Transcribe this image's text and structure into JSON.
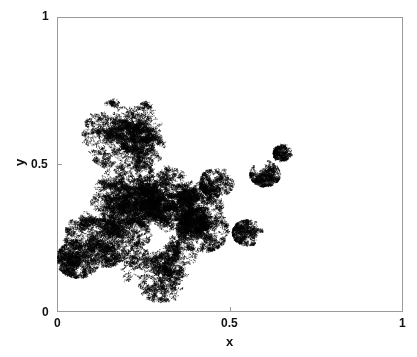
{
  "chart_data": {
    "type": "scatter",
    "title": "",
    "xlabel": "x",
    "ylabel": "y",
    "xlim": [
      0,
      1
    ],
    "ylim": [
      0,
      1
    ],
    "xticks": [
      "0",
      "0.5",
      "1"
    ],
    "yticks": [
      "0",
      "0.5",
      "1"
    ],
    "grid": false,
    "legend": null,
    "series": [
      {
        "name": "random walk trajectory",
        "color": "#000000",
        "description": "Dense 2D random walk cloud confined roughly to x 0-0.5, y 0-0.72, with an arm extending to about (0.65, 0.55) and a small cluster near (0.5-0.6, 0.25-0.3)",
        "extent": {
          "x": [
            0.0,
            0.67
          ],
          "y": [
            0.0,
            0.72
          ]
        },
        "clusters": [
          {
            "x": 0.2,
            "y": 0.6,
            "r": 0.1,
            "weight": 1.0
          },
          {
            "x": 0.25,
            "y": 0.37,
            "r": 0.12,
            "weight": 1.6
          },
          {
            "x": 0.38,
            "y": 0.37,
            "r": 0.08,
            "weight": 0.9
          },
          {
            "x": 0.12,
            "y": 0.25,
            "r": 0.08,
            "weight": 0.7
          },
          {
            "x": 0.3,
            "y": 0.15,
            "r": 0.09,
            "weight": 0.6
          },
          {
            "x": 0.06,
            "y": 0.18,
            "r": 0.05,
            "weight": 0.4
          },
          {
            "x": 0.42,
            "y": 0.28,
            "r": 0.06,
            "weight": 0.5
          },
          {
            "x": 0.55,
            "y": 0.27,
            "r": 0.035,
            "weight": 0.2
          },
          {
            "x": 0.6,
            "y": 0.47,
            "r": 0.035,
            "weight": 0.2
          },
          {
            "x": 0.65,
            "y": 0.54,
            "r": 0.02,
            "weight": 0.12
          },
          {
            "x": 0.46,
            "y": 0.44,
            "r": 0.04,
            "weight": 0.2
          }
        ]
      }
    ]
  },
  "axes": {
    "x_tick_0": "0",
    "x_tick_half": "0.5",
    "x_tick_1": "1",
    "y_tick_0": "0",
    "y_tick_half": "0.5",
    "y_tick_1": "1",
    "x_label": "x",
    "y_label": "y"
  }
}
